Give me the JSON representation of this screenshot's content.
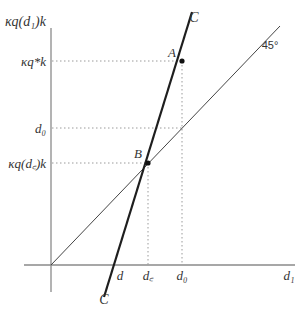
{
  "diagram": {
    "type": "economic-diagram",
    "y_axis": {
      "label": "κq(d₁)k",
      "ticks": [
        {
          "id": "kq_star",
          "label": "κq*k",
          "y": 61
        },
        {
          "id": "d0",
          "label": "d₀",
          "y": 128
        },
        {
          "id": "kq_dc",
          "label": "κq(d꜀)k",
          "y": 163
        }
      ]
    },
    "x_axis": {
      "label": "d₁",
      "ticks": [
        {
          "id": "d",
          "label": "d",
          "x": 120
        },
        {
          "id": "dc",
          "label": "d꜀",
          "x": 148
        },
        {
          "id": "d0",
          "label": "d₀",
          "x": 182
        }
      ]
    },
    "curves": [
      {
        "id": "C",
        "label_top": "C",
        "label_bottom": "C",
        "style": "thick"
      },
      {
        "id": "diag45",
        "label": "45°",
        "style": "thin"
      }
    ],
    "points": [
      {
        "id": "A",
        "label": "A",
        "x": 182,
        "y": 61
      },
      {
        "id": "B",
        "label": "B",
        "x": 148,
        "y": 163
      }
    ],
    "colors": {
      "axis": "#888888",
      "line": "#222222",
      "dotted": "#999999",
      "text": "#333333"
    }
  }
}
